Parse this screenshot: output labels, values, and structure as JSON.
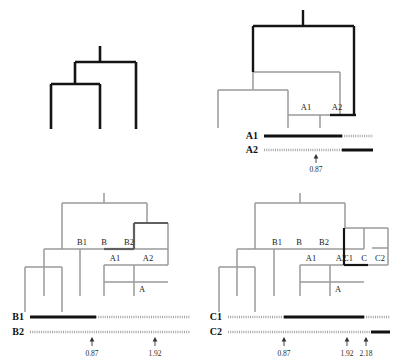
{
  "figure": {
    "type": "phylogenetic-tree-recombination-diagram",
    "width": 405,
    "height": 364,
    "background": "#ffffff",
    "colors": {
      "highlight": "#111111",
      "tree_gray": "#9a9a9a",
      "dotted_gray": "#a5a5a5",
      "text": "#1a1a1a"
    }
  },
  "panels": [
    {
      "id": "panel-a",
      "name": "top-left",
      "node_labels": [],
      "sequences": [],
      "ticks": []
    },
    {
      "id": "panel-b",
      "name": "top-right",
      "node_labels": [
        "A1",
        "A2"
      ],
      "sequences": [
        {
          "name": "A1",
          "segments": [
            {
              "style": "solid",
              "from": 0.0,
              "to": 0.87
            },
            {
              "style": "dotted",
              "from": 0.87,
              "to": 1.3
            }
          ]
        },
        {
          "name": "A2",
          "segments": [
            {
              "style": "dotted",
              "from": 0.0,
              "to": 0.87
            },
            {
              "style": "solid",
              "from": 0.87,
              "to": 1.3
            }
          ]
        }
      ],
      "ticks": [
        {
          "label": "0.87",
          "value": 0.87
        }
      ]
    },
    {
      "id": "panel-c",
      "name": "bottom-left",
      "node_labels": [
        "B1",
        "B",
        "B2",
        "A1",
        "A2",
        "A"
      ],
      "sequences": [
        {
          "name": "B1",
          "segments": [
            {
              "style": "solid",
              "from": 0.0,
              "to": 0.87
            },
            {
              "style": "dotted",
              "from": 0.87,
              "to": 2.6
            }
          ]
        },
        {
          "name": "B2",
          "segments": [
            {
              "style": "dotted",
              "from": 0.0,
              "to": 2.6
            }
          ]
        }
      ],
      "ticks": [
        {
          "label": "0.87",
          "value": 0.87
        },
        {
          "label": "1.92",
          "value": 1.92
        }
      ]
    },
    {
      "id": "panel-d",
      "name": "bottom-right",
      "node_labels": [
        "B1",
        "B",
        "B2",
        "C1",
        "C",
        "C2",
        "A1",
        "A2",
        "A"
      ],
      "sequences": [
        {
          "name": "C1",
          "segments": [
            {
              "style": "dotted",
              "from": 0.0,
              "to": 0.87
            },
            {
              "style": "solid",
              "from": 0.87,
              "to": 1.92
            },
            {
              "style": "dotted",
              "from": 1.92,
              "to": 2.6
            }
          ]
        },
        {
          "name": "C2",
          "segments": [
            {
              "style": "dotted",
              "from": 0.0,
              "to": 2.18
            },
            {
              "style": "solid",
              "from": 2.18,
              "to": 2.6
            }
          ]
        }
      ],
      "ticks": [
        {
          "label": "0.87",
          "value": 0.87
        },
        {
          "label": "1.92",
          "value": 1.92
        },
        {
          "label": "2.18",
          "value": 2.18
        }
      ]
    }
  ],
  "labels": {
    "A1": "A1",
    "A2": "A2",
    "A": "A",
    "B1": "B1",
    "B": "B",
    "B2": "B2",
    "C1": "C1",
    "C": "C",
    "C2": "C2"
  },
  "tick_values": {
    "t087": "0.87",
    "t192": "1.92",
    "t218": "2.18"
  }
}
